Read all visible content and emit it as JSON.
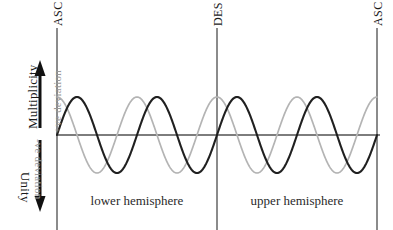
{
  "figure": {
    "width": 393,
    "height": 230,
    "background": "#ffffff"
  },
  "axes": {
    "vertical_top_label": "Multiplicity",
    "vertical_bottom_label": "Unity",
    "deviation_positive_label": "+ve deviation",
    "deviation_negative_label": "-ve deviation",
    "zero_line_color": "#7d7d7d"
  },
  "nodes": [
    {
      "label": "ASC",
      "x": 57
    },
    {
      "label": "DES",
      "x": 217
    },
    {
      "label": "ASC",
      "x": 377
    }
  ],
  "regions": [
    {
      "label": "lower hemisphere",
      "center_x": 137,
      "y": 200
    },
    {
      "label": "upper hemisphere",
      "center_x": 297,
      "y": 200
    }
  ],
  "colors": {
    "wave_primary": "#1f1f1f",
    "wave_secondary": "#b4b4b4",
    "node_line": "#6e6e6e",
    "arrow": "#111111",
    "deviation_text": "#9a9a9a",
    "axis_text": "#1a1a1a"
  },
  "chart_data": {
    "type": "line",
    "title": "",
    "xlabel": "",
    "ylabel": "Multiplicity / Unity",
    "xlim": [
      57,
      377
    ],
    "ylim": [
      -1,
      1
    ],
    "grid": false,
    "legend": "none",
    "zero_line_y": 135,
    "amplitude_px": 38,
    "period_px": 80,
    "cycles_per_hemisphere": 2,
    "annotations": [
      {
        "text": "ASC",
        "x": 57,
        "orientation": "vertical-ccw"
      },
      {
        "text": "DES",
        "x": 217,
        "orientation": "vertical-ccw"
      },
      {
        "text": "ASC",
        "x": 377,
        "orientation": "vertical-ccw"
      },
      {
        "text": "lower hemisphere",
        "x_range": [
          57,
          217
        ]
      },
      {
        "text": "upper hemisphere",
        "x_range": [
          217,
          377
        ]
      },
      {
        "text": "+ve deviation",
        "orientation": "vertical-ccw"
      },
      {
        "text": "-ve deviation",
        "orientation": "vertical-cw"
      },
      {
        "text": "Multiplicity",
        "orientation": "vertical-ccw",
        "arrow": "up"
      },
      {
        "text": "Unity",
        "orientation": "vertical-cw",
        "arrow": "down"
      }
    ],
    "series": [
      {
        "name": "wave-primary",
        "color": "#1f1f1f",
        "phase_deg": 0,
        "amplitude": 1,
        "period_px": 80,
        "description": "dark sine wave, rises from zero at first ASC"
      },
      {
        "name": "wave-secondary",
        "color": "#b4b4b4",
        "phase_deg": 90,
        "amplitude": 1,
        "period_px": 80,
        "description": "light grey sine wave, at positive peak at first ASC"
      }
    ]
  }
}
